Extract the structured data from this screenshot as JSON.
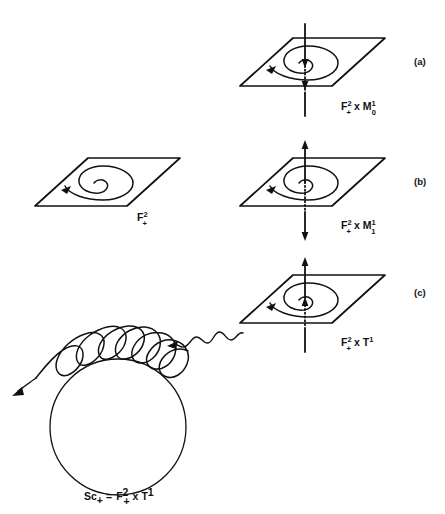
{
  "figure": {
    "background_color": "#ffffff",
    "ink_color": "#111111"
  },
  "panels": [
    {
      "id": "panel-a",
      "letter": "(a)",
      "label_main": "F",
      "label_main_sup": "2",
      "label_main_sub": "+",
      "label_operator": "x",
      "label_second": "M",
      "label_second_sup": "1",
      "label_second_sub": "0",
      "label_plain": "F2+ x M10",
      "has_axis": true,
      "axis_style": "inward-arrows",
      "spiral_direction": "counterclockwise"
    },
    {
      "id": "panel-b-left",
      "letter": "",
      "label_main": "F",
      "label_main_sup": "2",
      "label_main_sub": "+",
      "label_operator": "",
      "label_second": "",
      "label_second_sup": "",
      "label_second_sub": "",
      "label_plain": "F2+",
      "has_axis": false,
      "axis_style": "none",
      "spiral_direction": "counterclockwise"
    },
    {
      "id": "panel-b",
      "letter": "(b)",
      "label_main": "F",
      "label_main_sup": "2",
      "label_main_sub": "+",
      "label_operator": "x",
      "label_second": "M",
      "label_second_sup": "1",
      "label_second_sub": "1",
      "label_plain": "F2+ x M11",
      "has_axis": true,
      "axis_style": "outward-arrows",
      "spiral_direction": "counterclockwise"
    },
    {
      "id": "panel-c",
      "letter": "(c)",
      "label_main": "F",
      "label_main_sup": "2",
      "label_main_sub": "+",
      "label_operator": "x",
      "label_second": "T",
      "label_second_sup": "1",
      "label_second_sub": "",
      "label_plain": "F2+ x T1",
      "has_axis": true,
      "axis_style": "upward-arrows",
      "spiral_direction": "counterclockwise"
    }
  ],
  "bottom_figure": {
    "id": "solenoid",
    "label_prefix": "Sc",
    "label_prefix_sub": "+",
    "label_equals": "=",
    "label_main": "F",
    "label_main_sup": "2",
    "label_main_sub": "+",
    "label_operator": "x",
    "label_second": "T",
    "label_second_sup": "1",
    "label_plain": "Sc+ = F2+ x T1",
    "description": "circle with helical winding and outgoing arrow"
  },
  "connector": {
    "id": "wavy-arrow",
    "style": "wavy",
    "direction": "from panel (c) plane toward solenoid helix",
    "arrow_at": "lower-left"
  }
}
